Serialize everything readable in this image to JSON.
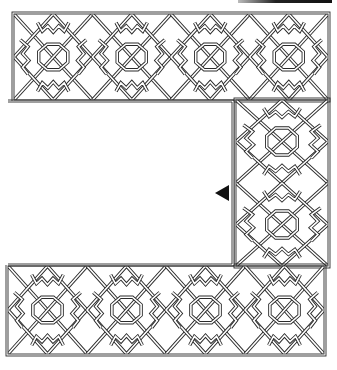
{
  "figure": {
    "colors": {
      "line": "#2a2a2a",
      "band_fill": "#ffffff",
      "background": "#ffffff",
      "marker": "#111111"
    },
    "bands": [
      {
        "name": "top",
        "x": 14,
        "y": 14,
        "w": 314,
        "h": 86,
        "tiles": 4
      },
      {
        "name": "right",
        "x": 236,
        "y": 100,
        "w": 92,
        "h": 166,
        "tiles": 2,
        "vertical": true
      },
      {
        "name": "bottom",
        "x": 8,
        "y": 266,
        "w": 316,
        "h": 88,
        "tiles": 4
      }
    ],
    "marker": {
      "shape": "left-pointing triangle",
      "x": 215,
      "y": 193
    },
    "top_bar": {
      "x": 238,
      "y": 0,
      "w": 94
    }
  }
}
